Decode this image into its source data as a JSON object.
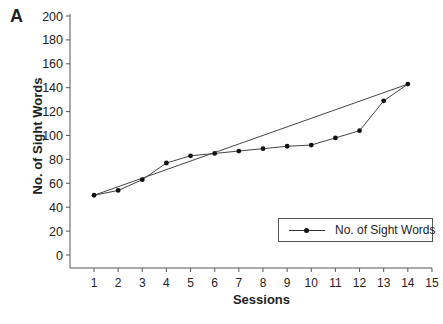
{
  "panel_label": "A",
  "chart_data": {
    "type": "line",
    "title": "",
    "panel": "A",
    "xlabel": "Sessions",
    "ylabel": "No. of Sight Words",
    "xlim": [
      0.2,
      15
    ],
    "ylim": [
      -10,
      205
    ],
    "x_ticks": [
      1,
      2,
      3,
      4,
      5,
      6,
      7,
      8,
      9,
      10,
      11,
      12,
      13,
      14,
      15
    ],
    "y_ticks": [
      0,
      20,
      40,
      60,
      80,
      100,
      120,
      140,
      160,
      180,
      200
    ],
    "grid": false,
    "legend": {
      "position": "lower right",
      "entries": [
        "No. of Sight Words"
      ]
    },
    "x": [
      1,
      2,
      3,
      4,
      5,
      6,
      7,
      8,
      9,
      10,
      11,
      12,
      13,
      14
    ],
    "series": [
      {
        "name": "No. of Sight Words",
        "marker": "circle",
        "values": [
          50,
          54,
          63,
          77,
          83,
          85,
          87,
          89,
          91,
          92,
          98,
          104,
          129,
          143
        ]
      },
      {
        "name": "Trend line",
        "marker": "none",
        "x": [
          1,
          14
        ],
        "values": [
          50,
          143
        ]
      }
    ]
  },
  "colors": {
    "axis": "#555555",
    "line": "#444444",
    "marker": "#111111",
    "text": "#222222"
  }
}
